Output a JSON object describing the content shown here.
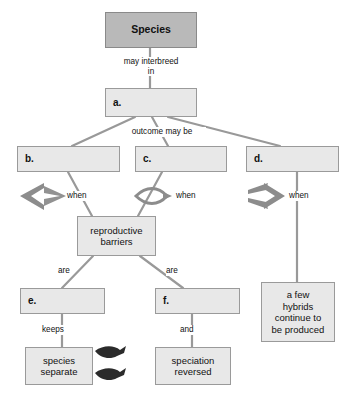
{
  "diagram": {
    "type": "concept-map",
    "colors": {
      "root_fill": "#b9b9b9",
      "node_fill": "#e8e8e8",
      "node_border": "#9a9a9a",
      "connector": "#999999",
      "symbol": "#8c8c8c",
      "fish": "#2b2b2b",
      "background": "#ffffff"
    },
    "nodes": [
      {
        "id": "species",
        "label": "Species",
        "style": "root",
        "blank": false
      },
      {
        "id": "a",
        "label": "a.",
        "style": "blank",
        "blank": true
      },
      {
        "id": "b",
        "label": "b.",
        "style": "blank",
        "blank": true
      },
      {
        "id": "c",
        "label": "c.",
        "style": "blank",
        "blank": true
      },
      {
        "id": "d",
        "label": "d.",
        "style": "blank",
        "blank": true
      },
      {
        "id": "barriers",
        "label": "reproductive\nbarriers",
        "style": "node",
        "blank": false
      },
      {
        "id": "e",
        "label": "e.",
        "style": "blank",
        "blank": true
      },
      {
        "id": "f",
        "label": "f.",
        "style": "blank",
        "blank": true
      },
      {
        "id": "hybrids",
        "label": "a few\nhybrids\ncontinue to\nbe produced",
        "style": "node",
        "blank": false
      },
      {
        "id": "separate",
        "label": "species\nseparate",
        "style": "node",
        "blank": false
      },
      {
        "id": "reversed",
        "label": "speciation\nreversed",
        "style": "node",
        "blank": false
      }
    ],
    "node_text": {
      "species": "Species",
      "a": "a.",
      "b": "b.",
      "c": "c.",
      "d": "d.",
      "barriers_line1": "reproductive",
      "barriers_line2": "barriers",
      "e": "e.",
      "f": "f.",
      "hybrids_line1": "a few",
      "hybrids_line2": "hybrids",
      "hybrids_line3": "continue to",
      "hybrids_line4": "be produced",
      "separate_line1": "species",
      "separate_line2": "separate",
      "reversed_line1": "speciation",
      "reversed_line2": "reversed"
    },
    "link_labels": {
      "may_interbreed_line1": "may interbreed",
      "may_interbreed_line2": "in",
      "outcome_may_be": "outcome may be",
      "when_b": "when",
      "when_c": "when",
      "when_d": "when",
      "are_left": "are",
      "are_right": "are",
      "keeps": "keeps",
      "and": "and"
    },
    "symbols": [
      {
        "id": "diverging-arrow",
        "name": "diverging-arrow-icon",
        "description": "arrow splitting into two branches"
      },
      {
        "id": "lens-arrow",
        "name": "lens-arrow-icon",
        "description": "arrows splitting then rejoining"
      },
      {
        "id": "converging-arrow",
        "name": "converging-arrow-icon",
        "description": "two branches merging into one arrow"
      },
      {
        "id": "fish-upper",
        "name": "fish-icon",
        "description": "dark fish pointing right"
      },
      {
        "id": "fish-lower",
        "name": "fish-icon",
        "description": "dark fish pointing right"
      }
    ]
  }
}
